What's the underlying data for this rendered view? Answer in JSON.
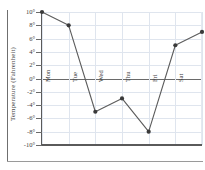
{
  "chart_data": {
    "type": "line",
    "title": "",
    "xlabel": "",
    "ylabel": "Temperature (Fahrenheit)",
    "categories": [
      "Mon",
      "Tue",
      "Wed",
      "Thu",
      "Fri",
      "Sat",
      "Sun"
    ],
    "values": [
      10,
      8,
      -5,
      -3,
      -8,
      5,
      7
    ],
    "series": [
      {
        "name": "Temperature",
        "values": [
          10,
          8,
          -5,
          -3,
          -8,
          5,
          7
        ]
      }
    ],
    "ylim": [
      -10,
      10
    ],
    "yticks": [
      10,
      8,
      6,
      4,
      2,
      0,
      -2,
      -4,
      -6,
      -8,
      -10
    ],
    "ytick_labels": [
      "10°",
      "8°",
      "6°",
      "4°",
      "2°",
      "0°",
      "-2°",
      "-4°",
      "-6°",
      "-8°",
      "-10°"
    ],
    "grid": true,
    "legend": false,
    "legend_position": "none",
    "zero_line": true,
    "colors": {
      "line": "#5c5c5c",
      "marker": "#3a3a3a",
      "grid": "#dfe5ee",
      "axis": "#5a5a5a",
      "text": "#3a3a3a",
      "background": "#ffffff"
    }
  }
}
